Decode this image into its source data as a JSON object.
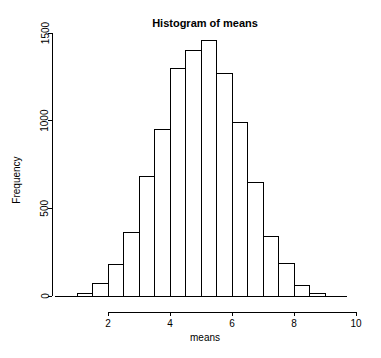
{
  "chart_data": {
    "type": "bar",
    "title": "Histogram of means",
    "xlabel": "means",
    "ylabel": "Frequency",
    "grid": false,
    "legend": "none",
    "xlim": [
      1.0,
      10.0
    ],
    "ylim": [
      0,
      1500
    ],
    "bin_width": 0.5,
    "x_ticks": [
      2,
      4,
      6,
      8,
      10
    ],
    "x_tick_labels": [
      "2",
      "4",
      "6",
      "8",
      "10"
    ],
    "y_ticks": [
      0,
      500,
      1000,
      1500
    ],
    "y_tick_labels": [
      "0",
      "500",
      "1000",
      "1500"
    ],
    "bin_edges": [
      1.0,
      1.5,
      2.0,
      2.5,
      3.0,
      3.5,
      4.0,
      4.5,
      5.0,
      5.5,
      6.0,
      6.5,
      7.0,
      7.5,
      8.0,
      8.5,
      9.0
    ],
    "categories": [
      "1.0-1.5",
      "1.5-2.0",
      "2.0-2.5",
      "2.5-3.0",
      "3.0-3.5",
      "3.5-4.0",
      "4.0-4.5",
      "4.5-5.0",
      "5.0-5.5",
      "5.5-6.0",
      "6.0-6.5",
      "6.5-7.0",
      "7.0-7.5",
      "7.5-8.0",
      "8.0-8.5",
      "8.5-9.0"
    ],
    "values": [
      15,
      70,
      180,
      360,
      680,
      950,
      1300,
      1400,
      1455,
      1270,
      990,
      650,
      340,
      185,
      60,
      15
    ],
    "series": [
      {
        "name": "Frequency",
        "values": [
          15,
          70,
          180,
          360,
          680,
          950,
          1300,
          1400,
          1455,
          1270,
          990,
          650,
          340,
          185,
          60,
          15
        ]
      }
    ]
  },
  "labels": {
    "title": "Histogram of means",
    "xlabel": "means",
    "ylabel": "Frequency"
  }
}
